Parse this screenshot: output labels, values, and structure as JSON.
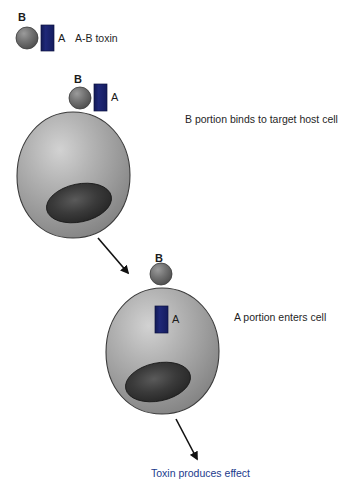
{
  "diagram": {
    "background_color": "#ffffff"
  },
  "colors": {
    "b_subunit": "#6e6e6e",
    "b_subunit_dark": "#3f3f3f",
    "a_subunit": "#1a2370",
    "cell_body": "#9a9a9a",
    "cell_highlight": "#c9c9c9",
    "cell_outline": "#3a3a3a",
    "nucleus": "#2b2b2b",
    "arrow": "#111111",
    "caption_text": "#1f1f1f",
    "effect_text": "#1b3a8c"
  },
  "legend": {
    "b_label": "B",
    "a_label": "A",
    "title": "A-B toxin",
    "b_icon": "sphere-icon",
    "a_icon": "rectangle-icon"
  },
  "steps": [
    {
      "id": "step-binding",
      "caption": "B portion binds to target host cell",
      "b_label": "B",
      "a_label": "A",
      "cell_icon": "cell-sphere-icon",
      "nucleus_icon": "nucleus-ellipse-icon",
      "toxin_position": "surface"
    },
    {
      "id": "step-entry",
      "caption": "A portion enters cell",
      "b_label": "B",
      "a_label": "A",
      "cell_icon": "cell-sphere-icon",
      "nucleus_icon": "nucleus-ellipse-icon",
      "toxin_position": "internal"
    }
  ],
  "outcome": {
    "caption": "Toxin produces effect",
    "arrow_icon": "arrow-down-right-icon"
  },
  "arrows": [
    {
      "id": "arrow-step1-to-step2",
      "icon": "arrow-down-right-icon"
    },
    {
      "id": "arrow-step2-to-effect",
      "icon": "arrow-down-right-icon"
    }
  ]
}
